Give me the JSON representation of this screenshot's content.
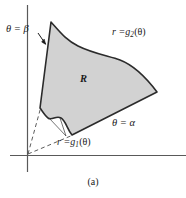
{
  "figure": {
    "caption": "(a)",
    "labels": {
      "theta_beta": "θ = β",
      "theta_alpha": "θ = α",
      "region": "R",
      "outer_curve_prefix": "r =",
      "outer_curve_fn": "g",
      "outer_curve_sub": "2",
      "outer_curve_arg": "(θ)",
      "inner_curve_prefix": "r =",
      "inner_curve_fn": "g",
      "inner_curve_sub": "1",
      "inner_curve_arg": "(θ)",
      "outer_curve_full": "r = g2(θ)",
      "inner_curve_full": "r = g1(θ)"
    },
    "colors": {
      "region_fill": "#d2d2d2",
      "region_stroke": "#2b2b2b",
      "axis": "#555555",
      "dashed": "#4a4a4a",
      "text": "#1a1a1a",
      "background": "#ffffff"
    },
    "geometry": {
      "origin": {
        "x": 27,
        "y": 155
      },
      "vertical_axis": {
        "x": 27,
        "y_top": 5,
        "y_bottom": 172
      },
      "horizontal_axis": {
        "y": 155,
        "x_left": 10,
        "x_right": 186
      },
      "vertices": {
        "top_left_peak": {
          "x": 51,
          "y": 22
        },
        "right_corner": {
          "x": 157,
          "y": 92
        },
        "bottom_vertex": {
          "x": 72,
          "y": 135
        },
        "left_corner": {
          "x": 40,
          "y": 108
        }
      },
      "ray_alpha": {
        "from": {
          "x": 27,
          "y": 155
        },
        "to": {
          "x": 157,
          "y": 92
        }
      },
      "ray_beta": {
        "from": {
          "x": 27,
          "y": 155
        },
        "to": {
          "x": 51,
          "y": 22
        }
      }
    }
  }
}
